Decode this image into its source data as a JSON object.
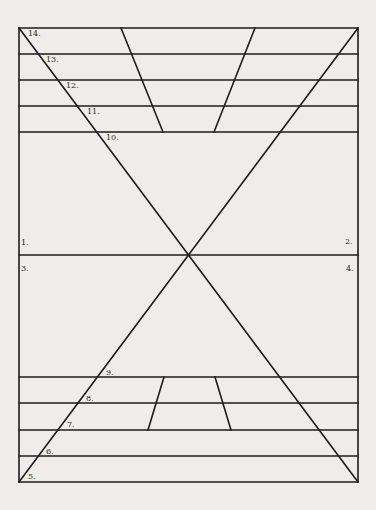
{
  "figure": {
    "type": "geometric line diagram",
    "frame": {
      "left": 19,
      "top": 28,
      "right": 358,
      "bottom": 482
    },
    "stroke_color": "#1c1c1c",
    "background_color": "#eeede9",
    "horizontal_lines_y": [
      28,
      54,
      80,
      106,
      132,
      255,
      377,
      403,
      430,
      456,
      482
    ],
    "diagonals": [
      {
        "name": "diagonal-top-left-to-bottom-right",
        "x1": 19,
        "y1": 28,
        "x2": 358,
        "y2": 482
      },
      {
        "name": "diagonal-top-right-to-bottom-left",
        "x1": 358,
        "y1": 28,
        "x2": 19,
        "y2": 482
      }
    ],
    "top_trapezoid": [
      {
        "name": "top-trapezoid-left-leg",
        "x1": 121,
        "y1": 28,
        "x2": 163,
        "y2": 132
      },
      {
        "name": "top-trapezoid-right-leg",
        "x1": 255,
        "y1": 28,
        "x2": 214,
        "y2": 132
      }
    ],
    "bottom_trapezoid": [
      {
        "name": "bottom-trapezoid-left-leg",
        "x1": 164,
        "y1": 377,
        "x2": 148,
        "y2": 430
      },
      {
        "name": "bottom-trapezoid-right-leg",
        "x1": 215,
        "y1": 377,
        "x2": 231,
        "y2": 430
      }
    ],
    "labels": [
      {
        "text": "1.",
        "x": 21,
        "y": 239
      },
      {
        "text": "2.",
        "x": 345,
        "y": 238
      },
      {
        "text": "3.",
        "x": 21,
        "y": 265
      },
      {
        "text": "4.",
        "x": 346,
        "y": 265
      },
      {
        "text": "5.",
        "x": 28,
        "y": 473
      },
      {
        "text": "6.",
        "x": 46,
        "y": 448
      },
      {
        "text": "7.",
        "x": 67,
        "y": 421
      },
      {
        "text": "8.",
        "x": 86,
        "y": 395
      },
      {
        "text": "9.",
        "x": 106,
        "y": 369
      },
      {
        "text": "10.",
        "x": 106,
        "y": 134
      },
      {
        "text": "11.",
        "x": 87,
        "y": 108
      },
      {
        "text": "12.",
        "x": 66,
        "y": 82
      },
      {
        "text": "13.",
        "x": 46,
        "y": 56
      },
      {
        "text": "14.",
        "x": 28,
        "y": 30
      }
    ]
  }
}
